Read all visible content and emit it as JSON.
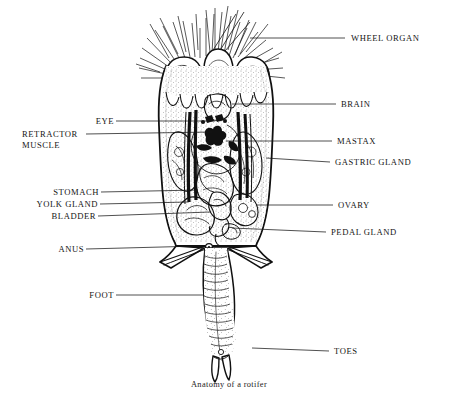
{
  "figure": {
    "title": "Anatomy of a rotifer",
    "kind": "labeled-anatomical-diagram",
    "subject": "rotifer",
    "style": "black-and-white stippled line engraving",
    "background_color": "#ffffff",
    "ink_color": "#111111",
    "caption": "Anatomy of a rotifer"
  },
  "labels": {
    "left": [
      {
        "id": "eye",
        "text": "EYE",
        "text_x": 110,
        "text_y": 124,
        "line_x1": 116,
        "line_y1": 121,
        "line_x2": 215,
        "line_y2": 121
      },
      {
        "id": "retractor",
        "text": "RETRACTOR",
        "text_x": 22,
        "text_y": 137,
        "line_x1": 86,
        "line_y1": 134,
        "line_x2": 210,
        "line_y2": 134
      },
      {
        "id": "retractor2",
        "text": "MUSCLE",
        "text_x": 22,
        "text_y": 148,
        "line_x1": null,
        "line_y1": null,
        "line_x2": null,
        "line_y2": null
      },
      {
        "id": "stomach",
        "text": "STOMACH",
        "text_x": 45,
        "text_y": 195,
        "line_x1": 101,
        "line_y1": 192,
        "line_x2": 196,
        "line_y2": 192
      },
      {
        "id": "yolk-gland",
        "text": "YOLK GLAND",
        "text_x": 30,
        "text_y": 207,
        "line_x1": 100,
        "line_y1": 204,
        "line_x2": 186,
        "line_y2": 204
      },
      {
        "id": "bladder",
        "text": "BLADDER",
        "text_x": 42,
        "text_y": 219,
        "line_x1": 98,
        "line_y1": 216,
        "line_x2": 205,
        "line_y2": 214
      },
      {
        "id": "anus",
        "text": "ANUS",
        "text_x": 58,
        "text_y": 252,
        "line_x1": 86,
        "line_y1": 249,
        "line_x2": 198,
        "line_y2": 245
      },
      {
        "id": "foot",
        "text": "FOOT",
        "text_x": 89,
        "text_y": 298,
        "line_x1": 116,
        "line_y1": 295,
        "line_x2": 202,
        "line_y2": 295
      }
    ],
    "right": [
      {
        "id": "wheel-organ",
        "text": "WHEEL ORGAN",
        "text_x": 352,
        "text_y": 41,
        "line_x1": 345,
        "line_y1": 38,
        "line_x2": 252,
        "line_y2": 38
      },
      {
        "id": "brain",
        "text": "BRAIN",
        "text_x": 341,
        "text_y": 107,
        "line_x1": 336,
        "line_y1": 104,
        "line_x2": 234,
        "line_y2": 104
      },
      {
        "id": "mastax",
        "text": "MASTAX",
        "text_x": 337,
        "text_y": 144,
        "line_x1": 332,
        "line_y1": 141,
        "line_x2": 225,
        "line_y2": 141
      },
      {
        "id": "gastric-gland",
        "text": "GASTRIC GLAND",
        "text_x": 335,
        "text_y": 165,
        "line_x1": 330,
        "line_y1": 162,
        "line_x2": 268,
        "line_y2": 159
      },
      {
        "id": "ovary",
        "text": "OVARY",
        "text_x": 338,
        "text_y": 208,
        "line_x1": 333,
        "line_y1": 205,
        "line_x2": 258,
        "line_y2": 205
      },
      {
        "id": "pedal-gland",
        "text": "PEDAL GLAND",
        "text_x": 331,
        "text_y": 235,
        "line_x1": 326,
        "line_y1": 232,
        "line_x2": 228,
        "line_y2": 227
      },
      {
        "id": "toes",
        "text": "TOES",
        "text_x": 334,
        "text_y": 354,
        "line_x1": 329,
        "line_y1": 351,
        "line_x2": 253,
        "line_y2": 348
      }
    ]
  },
  "anatomy_parts": [
    "wheel organ",
    "brain",
    "eye",
    "retractor muscle",
    "mastax",
    "gastric gland",
    "stomach",
    "yolk gland",
    "ovary",
    "bladder",
    "pedal gland",
    "anus",
    "foot",
    "toes"
  ],
  "caption_pos": {
    "x": 229,
    "y": 387
  }
}
